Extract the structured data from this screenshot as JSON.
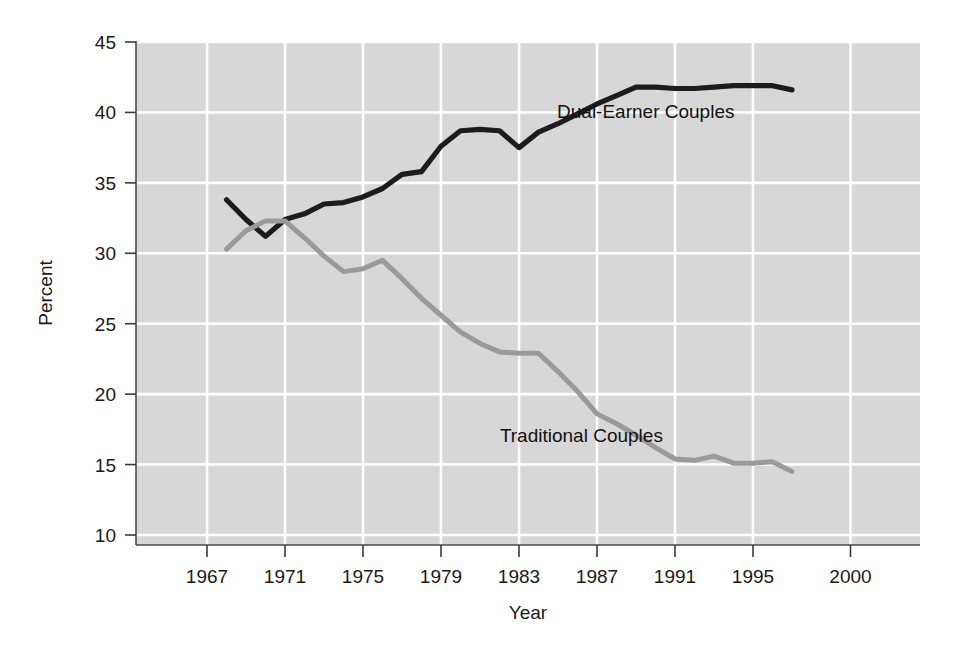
{
  "chart_data": {
    "type": "line",
    "title": "",
    "subtitle": "",
    "xlabel": "Year",
    "ylabel": "Percent",
    "xlim": [
      1965,
      2001
    ],
    "ylim": [
      7.5,
      45
    ],
    "xticks": [
      "1967",
      "1971",
      "1975",
      "1979",
      "1983",
      "1987",
      "1991",
      "1995",
      "2000"
    ],
    "xtick_values": [
      1967,
      1971,
      1975,
      1979,
      1983,
      1987,
      1991,
      1995,
      2000
    ],
    "yticks": [
      "45",
      "40",
      "35",
      "30",
      "25",
      "20",
      "15",
      "10"
    ],
    "ytick_values": [
      45,
      40,
      35,
      30,
      25,
      20,
      15,
      10
    ],
    "grid": true,
    "grid_color": "#ffffff",
    "plot_background": "#d7d7d7",
    "legend_position": "inline-annotations",
    "x": [
      1968,
      1969,
      1970,
      1971,
      1972,
      1973,
      1974,
      1975,
      1976,
      1977,
      1978,
      1979,
      1980,
      1981,
      1982,
      1983,
      1984,
      1985,
      1986,
      1987,
      1988,
      1989,
      1990,
      1991,
      1992,
      1993,
      1994,
      1995,
      1996,
      1997
    ],
    "series": [
      {
        "name": "Dual-Earner Couples",
        "color": "#1c1c1c",
        "label_x": 1989.5,
        "label_y": 39.6,
        "values": [
          33.8,
          32.4,
          31.2,
          32.4,
          32.8,
          33.5,
          33.6,
          34.0,
          34.6,
          35.6,
          35.8,
          37.6,
          38.7,
          38.8,
          38.7,
          37.5,
          38.6,
          39.2,
          39.9,
          40.6,
          41.2,
          41.8,
          41.8,
          41.7,
          41.7,
          41.8,
          41.9,
          41.9,
          41.9,
          41.6
        ]
      },
      {
        "name": "Traditional Couples",
        "color": "#9a9a9a",
        "label_x": 1986.2,
        "label_y": 16.6,
        "values": [
          30.3,
          31.6,
          32.3,
          32.3,
          31.1,
          29.8,
          28.7,
          28.9,
          29.5,
          28.2,
          26.8,
          25.6,
          24.4,
          23.6,
          23.0,
          22.9,
          22.9,
          21.6,
          20.2,
          18.6,
          17.9,
          17.1,
          16.2,
          15.4,
          15.3,
          15.6,
          15.1,
          15.1,
          15.2,
          14.5
        ]
      }
    ],
    "annotations": [
      {
        "text": "Dual-Earner Couples",
        "x": 1989.5,
        "y": 39.6
      },
      {
        "text": "Traditional Couples",
        "x": 1986.2,
        "y": 16.6
      }
    ]
  },
  "axes": {
    "x_axis_title": "Year",
    "y_axis_title": "Percent"
  }
}
